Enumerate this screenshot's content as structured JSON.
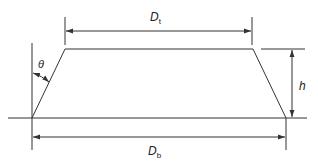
{
  "diagram": {
    "type": "trapezoid cross-section with dimensions",
    "labels": {
      "top_width": {
        "main": "D",
        "sub": "t"
      },
      "bottom_width": {
        "main": "D",
        "sub": "b"
      },
      "height": "h",
      "angle": "θ"
    },
    "colors": {
      "line": "#333333",
      "text": "#222222",
      "background": "#ffffff"
    }
  }
}
